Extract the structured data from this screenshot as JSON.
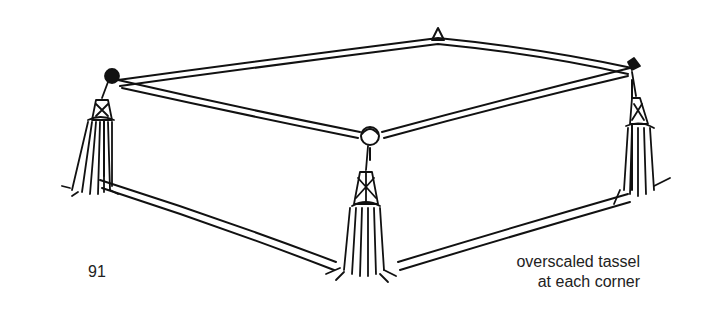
{
  "figure": {
    "number": "91",
    "caption": {
      "line1": "overscaled tassel",
      "line2": "at each corner"
    }
  }
}
